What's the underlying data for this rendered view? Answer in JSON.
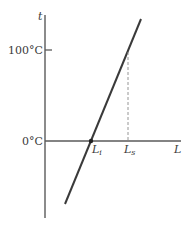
{
  "diagram": {
    "axes": {
      "y_label": "t",
      "x_label": "L",
      "y_ticks": [
        {
          "label": "100°C",
          "value": 100
        },
        {
          "label": "0°C",
          "value": 0
        }
      ]
    },
    "points": {
      "li": {
        "base": "L",
        "sub": "i"
      },
      "ls": {
        "base": "L",
        "sub": "s"
      }
    },
    "colors": {
      "axis": "#5a5a5a",
      "line": "#3a3a3a",
      "dashed": "#8a8a8a",
      "text": "#3a3a3a"
    }
  }
}
